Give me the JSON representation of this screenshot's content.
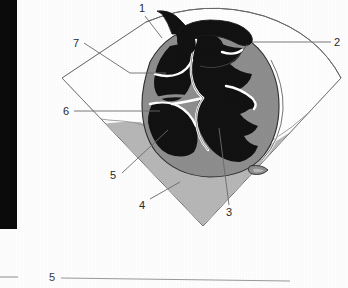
{
  "figure": {
    "type": "anatomical-ultrasound-diagram",
    "colors": {
      "background": "#fefefe",
      "sector_outline": "#5a5a5a",
      "cavity_black": "#111111",
      "myocardium_gray": "#8e8e8e",
      "tissue_light_gray": "#b7b7b7",
      "septum_white": "#ffffff",
      "leader_line": "#6b6b6b",
      "label_text": "#2a2a2a",
      "black_bar": "#0b0b0b"
    },
    "labels": [
      {
        "id": "1",
        "text": "1",
        "x": 139,
        "y": 3
      },
      {
        "id": "2",
        "text": "2",
        "x": 334,
        "y": 37
      },
      {
        "id": "3",
        "text": "3",
        "x": 226,
        "y": 207
      },
      {
        "id": "4",
        "text": "4",
        "x": 139,
        "y": 200
      },
      {
        "id": "5",
        "text": "5",
        "x": 110,
        "y": 170
      },
      {
        "id": "6",
        "text": "6",
        "x": 63,
        "y": 106
      },
      {
        "id": "7",
        "text": "7",
        "x": 73,
        "y": 38
      }
    ],
    "caption": {
      "number": "5"
    },
    "black_bar": {
      "x": 0,
      "y": 0,
      "width": 17,
      "height": 229
    }
  }
}
